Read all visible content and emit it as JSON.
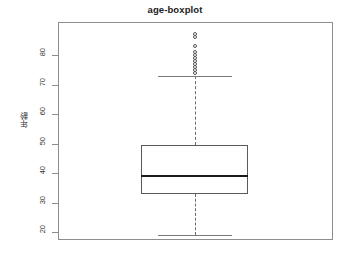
{
  "chart_data": {
    "type": "box",
    "title": "age-boxplot",
    "xlabel": "",
    "ylabel": "年齢",
    "ylim": [
      16,
      89
    ],
    "grid": false,
    "legend": null,
    "y_ticks": [
      {
        "value": 80,
        "label": "80"
      },
      {
        "value": 70,
        "label": "70"
      },
      {
        "value": 60,
        "label": "60"
      },
      {
        "value": 50,
        "label": "50"
      },
      {
        "value": 40,
        "label": "40"
      },
      {
        "value": 30,
        "label": "30"
      },
      {
        "value": 20,
        "label": "20"
      }
    ],
    "boxes": [
      {
        "name": "age",
        "lower_whisker": 19,
        "q1": 33,
        "median": 39,
        "q3": 49.5,
        "upper_whisker": 73,
        "outliers": [
          74,
          75,
          76,
          77,
          78,
          79,
          80,
          81,
          83,
          86,
          87
        ]
      }
    ],
    "colors": {
      "frame": "#8d8d8d",
      "box_border": "#5a5a5a",
      "median": "#1a1a1a",
      "whisker": "#6b6b6b",
      "outlier": "#555555",
      "background": "#ffffff"
    }
  }
}
